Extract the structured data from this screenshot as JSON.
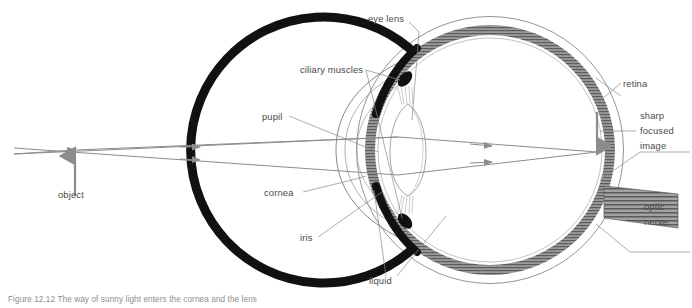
{
  "figure": {
    "caption": "Figure 12.12  The way of sunny light enters the cornea and the lens",
    "background_color": "#ffffff",
    "label_color": "#4a4a4a",
    "ray_color": "#8c8c8c",
    "sclera_color": "#111111",
    "retina_color": "#6e6e6e",
    "outline_color": "#7a7a7a"
  },
  "labels": {
    "eye_lens": "eye lens",
    "ciliary_muscles": "ciliary muscles",
    "pupil": "pupil",
    "cornea": "cornea",
    "iris": "iris",
    "liquid": "liquid",
    "object": "object",
    "retina": "retina",
    "sharp_focused_image": [
      "sharp",
      "focused",
      "image"
    ],
    "optic_nerve": [
      "optic",
      "nerve"
    ]
  },
  "diagram": {
    "eye_center": {
      "x": 490,
      "y": 150
    },
    "eye_radius": 133,
    "object_arrow": {
      "x": 75,
      "base_y": 196,
      "tip_y": 150
    },
    "focus_point": {
      "x": 597,
      "y": 152
    },
    "image_arrow": {
      "x": 597,
      "top_y": 117,
      "bottom_y": 152
    },
    "ray_count": 2
  }
}
